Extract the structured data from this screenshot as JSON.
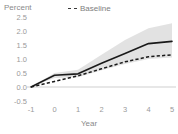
{
  "chart_data": {
    "type": "line",
    "title": "",
    "subtitle": "",
    "xlabel": "Year",
    "ylabel": "Percent",
    "ylabel_position": "top-left",
    "x": [
      -1,
      0,
      1,
      2,
      3,
      4,
      5
    ],
    "xticklabels": [
      "-1",
      "0",
      "1",
      "2",
      "3",
      "4",
      "5"
    ],
    "yticks": [
      -0.5,
      0.0,
      0.5,
      1.0,
      1.5,
      2.0,
      2.5
    ],
    "yticklabels": [
      "-0.5",
      "0.0",
      "0.5",
      "1.0",
      "1.5",
      "2.0",
      "2.5"
    ],
    "xlim": [
      -1,
      5
    ],
    "ylim": [
      -0.5,
      2.5
    ],
    "grid": false,
    "zero_line": true,
    "zero_line_value": 0.0,
    "legend_position": "top-center",
    "legend_entries": [
      "Baseline"
    ],
    "series": [
      {
        "name": "Main",
        "style": "solid",
        "color": "#1a1a1a",
        "in_legend": false,
        "values": [
          0.0,
          0.42,
          0.47,
          0.85,
          1.2,
          1.55,
          1.63
        ]
      },
      {
        "name": "Baseline",
        "style": "dashed",
        "color": "#1a1a1a",
        "in_legend": true,
        "values": [
          0.0,
          0.2,
          0.4,
          0.65,
          0.9,
          1.08,
          1.15
        ]
      }
    ],
    "confidence_band": {
      "name": "Confidence interval",
      "color": "#e0e0e0",
      "applies_to": "Main",
      "upper": [
        0.0,
        0.5,
        0.62,
        1.15,
        1.68,
        2.1,
        2.28
      ],
      "lower": [
        0.0,
        0.32,
        0.35,
        0.6,
        0.82,
        1.0,
        1.05
      ]
    }
  },
  "labels": {
    "ylabel": "Percent",
    "xlabel": "Year",
    "legend_baseline": "Baseline"
  },
  "colors": {
    "background": "#ffffff",
    "line": "#1a1a1a",
    "band": "#e0e0e0",
    "tick_text": "#9a9a9a",
    "axis_title": "#8a8a8a",
    "zero_line": "#cfcfcf"
  }
}
